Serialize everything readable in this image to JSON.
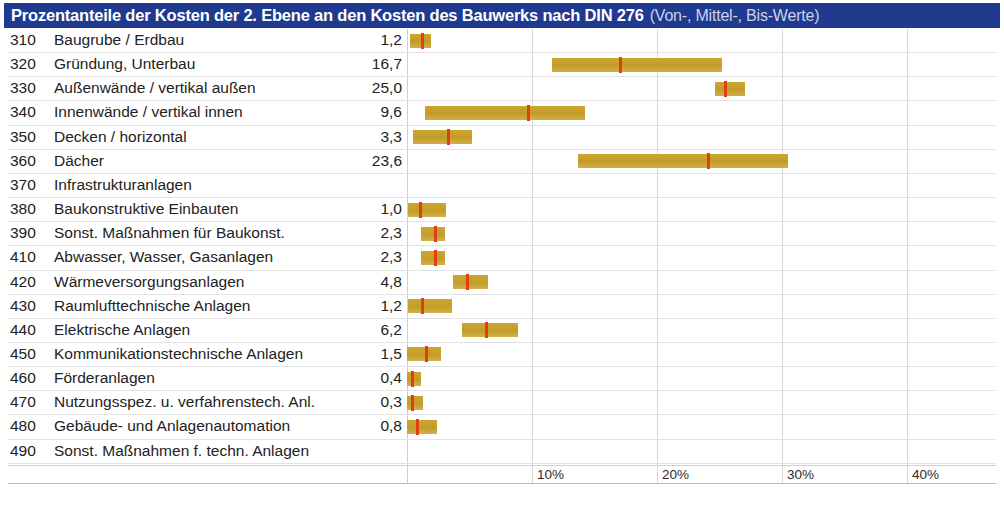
{
  "title": {
    "main": "Prozentanteile der Kosten der 2. Ebene an den Kosten des Bauwerks nach DIN 276",
    "sub": "(Von-, Mittel-, Bis-Werte)"
  },
  "colors": {
    "title_bar": "#1f3a8f",
    "title_text": "#ffffff",
    "title_sub_text": "#c9d2ea",
    "bar": "#c6a02c",
    "marker": "#e63c14",
    "gridline": "#d6d6d6",
    "row_separator": "#e2e2e2"
  },
  "axis": {
    "ticks": [
      "10%",
      "20%",
      "30%",
      "40%"
    ],
    "tick_values": [
      10,
      20,
      30,
      40
    ],
    "min": 0,
    "max": 45
  },
  "chart_data": {
    "type": "bar",
    "title": "Prozentanteile der Kosten der 2. Ebene an den Kosten des Bauwerks nach DIN 276",
    "subtitle": "(Von-, Mittel-, Bis-Werte)",
    "xlabel": "",
    "ylabel": "",
    "xlim": [
      0,
      45
    ],
    "grid": true,
    "legend": "none",
    "value_column_header": "",
    "note": "Floating bars: from = Von-Wert, mid = Mittel-Wert (red marker, shown in value column), to = Bis-Wert",
    "categories": [
      "310 Baugrube / Erdbau",
      "320 Gründung, Unterbau",
      "330 Außenwände / vertikal außen",
      "340 Innenwände / vertikal innen",
      "350 Decken / horizontal",
      "360 Dächer",
      "370 Infrastrukturanlagen",
      "380 Baukonstruktive Einbauten",
      "390 Sonst. Maßnahmen für Baukonst.",
      "410 Abwasser, Wasser, Gasanlagen",
      "420 Wärmeversorgungsanlagen",
      "430 Raumlufttechnische Anlagen",
      "440 Elektrische Anlagen",
      "450 Kommunikationstechnische Anlagen",
      "460 Förderanlagen",
      "470 Nutzungsspez. u. verfahrenstech. Anl.",
      "480 Gebäude- und Anlagenautomation",
      "490 Sonst. Maßnahmen f. techn. Anlagen"
    ],
    "rows": [
      {
        "code": "310",
        "label": "Baugrube / Erdbau",
        "value": "1,2",
        "from": 0.2,
        "mid": 1.2,
        "to": 1.9
      },
      {
        "code": "320",
        "label": "Gründung, Unterbau",
        "value": "16,7",
        "from": 11.6,
        "mid": 17.0,
        "to": 25.2
      },
      {
        "code": "330",
        "label": "Außenwände / vertikal außen",
        "value": "25,0",
        "from": 24.6,
        "mid": 25.4,
        "to": 27.0
      },
      {
        "code": "340",
        "label": "Innenwände / vertikal innen",
        "value": "9,6",
        "from": 1.4,
        "mid": 9.7,
        "to": 14.2
      },
      {
        "code": "350",
        "label": "Decken / horizontal",
        "value": "3,3",
        "from": 0.5,
        "mid": 3.3,
        "to": 5.2
      },
      {
        "code": "360",
        "label": "Dächer",
        "value": "23,6",
        "from": 13.7,
        "mid": 24.1,
        "to": 30.5
      },
      {
        "code": "370",
        "label": "Infrastrukturanlagen",
        "value": "",
        "from": null,
        "mid": null,
        "to": null
      },
      {
        "code": "380",
        "label": "Baukonstruktive Einbauten",
        "value": "1,0",
        "from": 0.1,
        "mid": 1.0,
        "to": 3.1
      },
      {
        "code": "390",
        "label": "Sonst. Maßnahmen für Baukonst.",
        "value": "2,3",
        "from": 1.1,
        "mid": 2.2,
        "to": 3.0
      },
      {
        "code": "410",
        "label": "Abwasser, Wasser, Gasanlagen",
        "value": "2,3",
        "from": 1.1,
        "mid": 2.2,
        "to": 3.0
      },
      {
        "code": "420",
        "label": "Wärmeversorgungsanlagen",
        "value": "4,8",
        "from": 3.7,
        "mid": 4.8,
        "to": 6.5
      },
      {
        "code": "430",
        "label": "Raumlufttechnische Anlagen",
        "value": "1,2",
        "from": 0.1,
        "mid": 1.2,
        "to": 3.6
      },
      {
        "code": "440",
        "label": "Elektrische Anlagen",
        "value": "6,2",
        "from": 4.4,
        "mid": 6.3,
        "to": 8.9
      },
      {
        "code": "450",
        "label": "Kommunikationstechnische Anlagen",
        "value": "1,5",
        "from": 0.0,
        "mid": 1.5,
        "to": 2.7
      },
      {
        "code": "460",
        "label": "Förderanlagen",
        "value": "0,4",
        "from": 0.0,
        "mid": 0.4,
        "to": 1.1
      },
      {
        "code": "470",
        "label": "Nutzungsspez. u. verfahrenstech. Anl.",
        "value": "0,3",
        "from": 0.0,
        "mid": 0.4,
        "to": 1.3
      },
      {
        "code": "480",
        "label": "Gebäude- und Anlagenautomation",
        "value": "0,8",
        "from": 0.0,
        "mid": 0.8,
        "to": 2.4
      },
      {
        "code": "490",
        "label": "Sonst. Maßnahmen f. techn. Anlagen",
        "value": "",
        "from": null,
        "mid": null,
        "to": null
      }
    ]
  }
}
